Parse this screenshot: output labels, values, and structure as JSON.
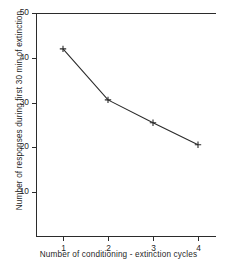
{
  "chart_data": {
    "type": "line",
    "title": "",
    "xlabel": "Number of  conditioning - extinction  cycles",
    "ylabel": "Number of responses during first 30 min of extinction",
    "x": [
      1,
      2,
      3,
      4
    ],
    "values": [
      42,
      30.6,
      25.5,
      20.6
    ],
    "series": [
      {
        "name": "",
        "values": [
          42,
          30.6,
          25.5,
          20.6
        ]
      }
    ],
    "xtick_labels": [
      "1",
      "2",
      "3",
      "4"
    ],
    "ytick_labels": [
      "10",
      "20",
      "30",
      "40",
      "50"
    ],
    "xticks": [
      1,
      2,
      3,
      4
    ],
    "yticks": [
      10,
      20,
      30,
      40,
      50
    ],
    "xlim": [
      0.4,
      4.4
    ],
    "ylim": [
      0,
      50
    ],
    "grid": false,
    "legend": false,
    "marker": "plus",
    "line_color": "#2b2b2b",
    "marker_color": "#2b2b2b",
    "background_color": "#ffffff"
  }
}
